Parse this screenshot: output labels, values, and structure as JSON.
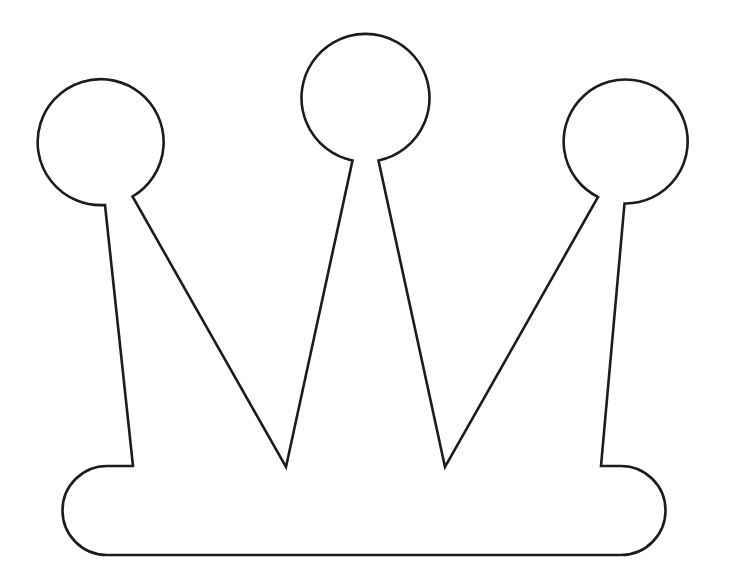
{
  "document": {
    "title": "Crown Outline Template",
    "type": "line-drawing",
    "description": "Black outline drawing of a crown with three circular ball tips, two deep V notches and a rounded rectangular band",
    "canvas": {
      "width": 731,
      "height": 583,
      "background_color": "#ffffff"
    },
    "stroke": {
      "color": "#1c1c1c",
      "width": 2.6,
      "fill_color": "#ffffff"
    }
  },
  "shape": {
    "name": "crown",
    "parts": [
      {
        "name": "left-ball",
        "kind": "circle",
        "cx": 98,
        "cy": 140,
        "r": 63
      },
      {
        "name": "center-ball",
        "kind": "circle",
        "cx": 365,
        "cy": 97,
        "r": 64
      },
      {
        "name": "right-ball",
        "kind": "circle",
        "cx": 631,
        "cy": 140,
        "r": 62
      },
      {
        "name": "left-spike-stem",
        "kind": "line",
        "from": [
          105,
          205
        ],
        "to": [
          133,
          467
        ]
      },
      {
        "name": "right-spike-stem",
        "kind": "line",
        "from": [
          624,
          203
        ],
        "to": [
          601,
          465
        ]
      },
      {
        "name": "left-v-notch",
        "kind": "vertex",
        "apex": [
          286,
          467
        ]
      },
      {
        "name": "right-v-notch",
        "kind": "vertex",
        "apex": [
          445,
          467
        ]
      },
      {
        "name": "band",
        "kind": "rounded-rect",
        "left": 63,
        "right": 665,
        "top": 466,
        "bottom": 555,
        "corner_radius": 44
      }
    ],
    "path_d": "M 133 466 L 105 205 A 63 63 0 1 1 132.5 196.5 L 286 467 L 352.5 160.5 A 64 64 0 1 1 378.5 160.5 L 445 467 L 598 197 A 62 62 0 1 1 624.5 203.5 L 601 466 L 621 466 A 44.5 44.5 0 0 1 621 555 L 107 555 A 44.5 44.5 0 0 1 107 466 Z"
  },
  "labels": {
    "none_visible": ""
  }
}
